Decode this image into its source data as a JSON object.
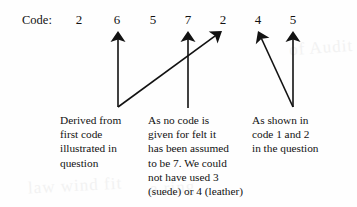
{
  "diagram": {
    "label": "Code:",
    "digits": [
      {
        "value": "2",
        "x": 72
      },
      {
        "value": "6",
        "x": 110
      },
      {
        "value": "5",
        "x": 146
      },
      {
        "value": "7",
        "x": 181
      },
      {
        "value": "2",
        "x": 216
      },
      {
        "value": "4",
        "x": 251
      },
      {
        "value": "5",
        "x": 286
      }
    ],
    "arrows": [
      {
        "name": "arrow-to-digit-6",
        "tip_x": 118,
        "tip_y": 31,
        "tail_x": 118,
        "tail_y": 107
      },
      {
        "name": "arrow-to-digit-7",
        "tip_x": 188,
        "tip_y": 31,
        "tail_x": 188,
        "tail_y": 108
      },
      {
        "name": "arrow-to-digit-2",
        "tip_x": 222,
        "tip_y": 31,
        "tail_x": 118,
        "tail_y": 107
      },
      {
        "name": "arrow-to-digit-4",
        "tip_x": 258,
        "tip_y": 31,
        "tail_x": 293,
        "tail_y": 107
      },
      {
        "name": "arrow-to-digit-5",
        "tip_x": 293,
        "tip_y": 31,
        "tail_x": 293,
        "tail_y": 107
      }
    ],
    "notes": {
      "left": "Derived from\nfirst code\nillustrated in\nquestion",
      "middle": "As no code is\ngiven for felt it\nhas been assumed\nto be 7.  We could\nnot have used 3\n(suede) or 4 (leather)",
      "right": "As shown in\ncode 1 and 2\nin the question"
    },
    "watermark": {
      "top_right": "of Audit",
      "bottom_left": "law wind fit",
      "bottom_middle": "a ring"
    },
    "colors": {
      "ink": "#121212",
      "background": "#fefefe",
      "watermark": "#f2f2f2"
    }
  }
}
